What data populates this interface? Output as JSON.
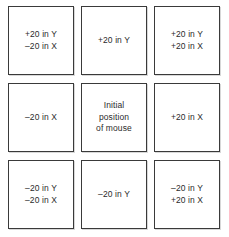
{
  "diagram": {
    "background_color": "#ffffff",
    "border_color": "#3a3a3a",
    "text_color": "#2b2b2b",
    "grid": {
      "rows": 3,
      "columns": 3
    },
    "cells": [
      {
        "position": "top-left",
        "lines": [
          "+20 in Y",
          "–20 in X"
        ]
      },
      {
        "position": "top-center",
        "lines": [
          "+20 in Y"
        ]
      },
      {
        "position": "top-right",
        "lines": [
          "+20 in Y",
          "+20 in X"
        ]
      },
      {
        "position": "middle-left",
        "lines": [
          "–20 in X"
        ]
      },
      {
        "position": "middle-center",
        "lines": [
          "Initial",
          "position",
          "of mouse"
        ]
      },
      {
        "position": "middle-right",
        "lines": [
          "+20 in X"
        ]
      },
      {
        "position": "bottom-left",
        "lines": [
          "–20 in Y",
          "–20 in X"
        ]
      },
      {
        "position": "bottom-center",
        "lines": [
          "–20 in Y"
        ]
      },
      {
        "position": "bottom-right",
        "lines": [
          "–20 in Y",
          "+20 in X"
        ]
      }
    ]
  }
}
